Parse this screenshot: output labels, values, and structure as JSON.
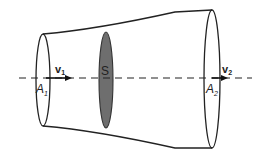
{
  "diagram": {
    "type": "fluid-flow-tube",
    "colors": {
      "stroke": "#222222",
      "cross_section_fill": "#6e6e6e",
      "background": "#ffffff"
    },
    "labels": {
      "v1": {
        "main": "v",
        "sub": "1"
      },
      "v2": {
        "main": "v",
        "sub": "2"
      },
      "a1": {
        "main": "A",
        "sub": "1"
      },
      "a2": {
        "main": "A",
        "sub": "2"
      },
      "s": "S"
    }
  }
}
